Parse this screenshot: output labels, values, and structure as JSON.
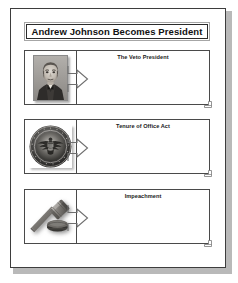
{
  "document": {
    "title": "Andrew Johnson Becomes President",
    "page_background": "#ffffff",
    "border_color": "#3d3d3d",
    "title_border_color": "#2b2b2b"
  },
  "rows": [
    {
      "id": "row-veto-president",
      "heading": "The Veto President",
      "image_name": "andrew-johnson-portrait",
      "image_alt": "Andrew Johnson portrait photograph",
      "arrow_name": "flow-arrow-right",
      "handle_name": "resize-handle",
      "notes_value": ""
    },
    {
      "id": "row-tenure-of-office-act",
      "heading": "Tenure of Office Act",
      "image_name": "presidential-seal",
      "image_alt": "Seal of the President of the United States",
      "arrow_name": "flow-arrow-right",
      "handle_name": "resize-handle",
      "notes_value": ""
    },
    {
      "id": "row-impeachment",
      "heading": "Impeachment",
      "image_name": "gavel",
      "image_alt": "Judge gavel resting on a sound block",
      "arrow_name": "flow-arrow-right",
      "handle_name": "resize-handle",
      "notes_value": ""
    }
  ]
}
